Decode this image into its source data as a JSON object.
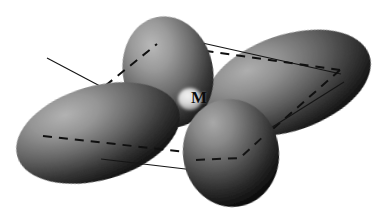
{
  "figure": {
    "background_color": "#ffffff",
    "width": 387,
    "height": 217
  },
  "center_atom": {
    "label": "M",
    "label_x": 196,
    "label_y": 98,
    "highlight_color": "#e8e8e8",
    "center_x": 190,
    "center_y": 100,
    "radius": 12
  },
  "palette": {
    "lobe_highlight": "#adadad",
    "lobe_mid": "#6e6e6e",
    "lobe_shadow": "#242424",
    "lobe_deep_shadow": "#101010",
    "line_color": "#151515",
    "dash_color": "#101010",
    "background": "#ffffff"
  },
  "orbital": {
    "type": "d-orbital",
    "lobe_count": 4,
    "lobes": [
      {
        "name": "lobe-top",
        "cx": 168,
        "cy": 72,
        "rx": 45,
        "ry": 56,
        "rotation": -12,
        "z_order": 2
      },
      {
        "name": "lobe-left",
        "cx": 98,
        "cy": 133,
        "rx": 84,
        "ry": 47,
        "rotation": -16,
        "z_order": 3
      },
      {
        "name": "lobe-right",
        "cx": 288,
        "cy": 83,
        "rx": 86,
        "ry": 48,
        "rotation": -19,
        "z_order": 1
      },
      {
        "name": "lobe-bottom",
        "cx": 231,
        "cy": 153,
        "rx": 48,
        "ry": 54,
        "rotation": -8,
        "z_order": 4
      }
    ]
  },
  "dashed_plane": {
    "name": "coordination-plane",
    "style": "dashed",
    "vertices": [
      {
        "x": 157,
        "y": 44
      },
      {
        "x": 340,
        "y": 70
      },
      {
        "x": 240,
        "y": 158
      },
      {
        "x": 43,
        "y": 136
      }
    ]
  },
  "solid_bonds": [
    {
      "name": "bond-top-left",
      "x1": 47,
      "y1": 58,
      "x2": 134,
      "y2": 104
    },
    {
      "name": "bond-top-right",
      "x1": 180,
      "y1": 38,
      "x2": 341,
      "y2": 74
    },
    {
      "name": "bond-bottom-left",
      "x1": 101,
      "y1": 159,
      "x2": 236,
      "y2": 175
    },
    {
      "name": "bond-bottom-right",
      "x1": 266,
      "y1": 131,
      "x2": 344,
      "y2": 82
    }
  ]
}
